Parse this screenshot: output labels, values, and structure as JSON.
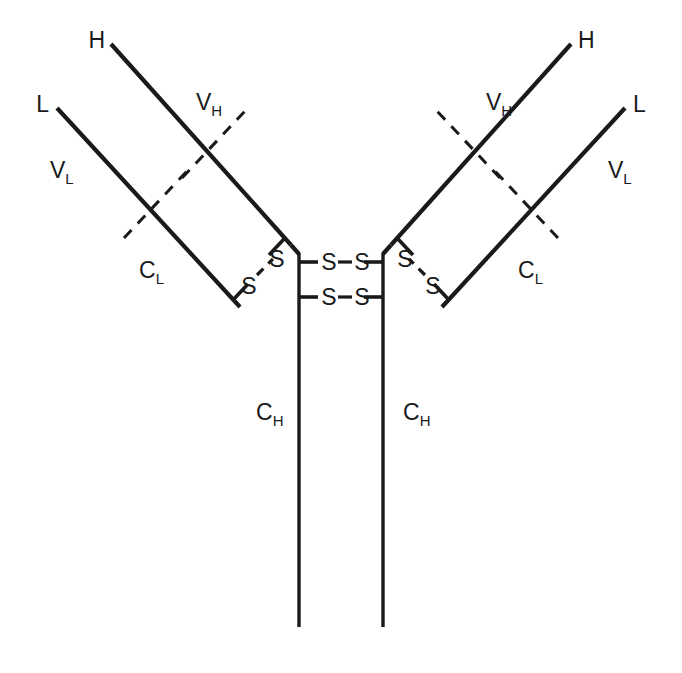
{
  "figure": {
    "kind": "antibody-structure-diagram",
    "molecule": "immunoglobulin-IgG",
    "background_color": "#ffffff",
    "line_color": "#1a1a1a"
  },
  "labels": {
    "heavy_chain_left": {
      "main": "H",
      "sub": ""
    },
    "heavy_chain_right": {
      "main": "H",
      "sub": ""
    },
    "light_chain_left": {
      "main": "L",
      "sub": ""
    },
    "light_chain_right": {
      "main": "L",
      "sub": ""
    },
    "variable_heavy_left": {
      "main": "V",
      "sub": "H"
    },
    "variable_heavy_right": {
      "main": "V",
      "sub": "H"
    },
    "variable_light_left": {
      "main": "V",
      "sub": "L"
    },
    "variable_light_right": {
      "main": "V",
      "sub": "L"
    },
    "constant_light_left": {
      "main": "C",
      "sub": "L"
    },
    "constant_light_right": {
      "main": "C",
      "sub": "L"
    },
    "constant_heavy_left": {
      "main": "C",
      "sub": "H"
    },
    "constant_heavy_right": {
      "main": "C",
      "sub": "H"
    }
  },
  "sulfurs": {
    "symbol": "S",
    "interchain_hl_left": [
      "S",
      "S"
    ],
    "interchain_hl_right": [
      "S",
      "S"
    ],
    "hinge_upper": [
      "S",
      "S"
    ],
    "hinge_lower": [
      "S",
      "S"
    ]
  },
  "geometry": {
    "heavy_left": {
      "x1": 111,
      "y1": 44,
      "x2": 291,
      "y2": 245
    },
    "heavy_right": {
      "x1": 571,
      "y1": 44,
      "x2": 391,
      "y2": 245
    },
    "light_left": {
      "x1": 57,
      "y1": 108,
      "x2": 240,
      "y2": 307
    },
    "light_right": {
      "x1": 625,
      "y1": 108,
      "x2": 442,
      "y2": 307
    },
    "stem_left": {
      "x": 299,
      "y1": 252,
      "y2": 627
    },
    "stem_right": {
      "x": 383,
      "y1": 252,
      "y2": 627
    },
    "divider_heavy_left": {
      "x1": 182,
      "y1": 178,
      "x2": 243,
      "y2": 113
    },
    "divider_heavy_right": {
      "x1": 500,
      "y1": 178,
      "x2": 439,
      "y2": 113
    },
    "divider_light_left": {
      "x1": 127,
      "y1": 235,
      "x2": 188,
      "y2": 170
    },
    "divider_light_right": {
      "x1": 555,
      "y1": 235,
      "x2": 494,
      "y2": 170
    }
  }
}
